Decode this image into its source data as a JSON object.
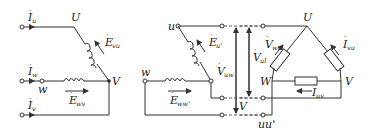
{
  "diagram": {
    "left": {
      "currents": [
        {
          "main": "I",
          "sub": "u"
        },
        {
          "main": "I",
          "sub": "w"
        },
        {
          "main": "I",
          "sub": "v"
        }
      ],
      "nodes": {
        "U": "U",
        "V": "V",
        "w": "w"
      },
      "emfs": [
        {
          "main": "E",
          "sub": "vu"
        },
        {
          "main": "E",
          "sub": "wv"
        }
      ]
    },
    "middle": {
      "nodes": {
        "u": "u",
        "w": "w"
      },
      "emfs": [
        {
          "main": "E",
          "sub": "u'"
        },
        {
          "main": "E",
          "sub": "ww'"
        }
      ],
      "voltages": [
        {
          "main": "V",
          "sub": "uw"
        },
        {
          "main": "V",
          "sub": "ul"
        },
        {
          "main": "V",
          "sub": ""
        }
      ]
    },
    "right": {
      "nodes": {
        "U": "U",
        "W": "W",
        "V": "V",
        "uu": "uu'"
      },
      "labels": [
        {
          "main": "V",
          "sub": "wu"
        },
        {
          "main": "I",
          "sub": "vu"
        },
        {
          "main": "I",
          "sub": "uv"
        }
      ]
    }
  }
}
